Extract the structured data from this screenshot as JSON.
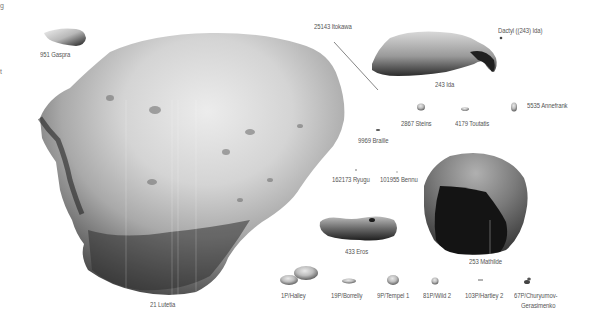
{
  "figure": {
    "background": "#ffffff",
    "label_color": "#555555",
    "bodies": [
      {
        "id": "lutetia",
        "label": "21 Lutetia",
        "kind": "asteroid"
      },
      {
        "id": "gaspra",
        "label": "951 Gaspra",
        "kind": "asteroid"
      },
      {
        "id": "itokawa",
        "label": "25143 Itokawa",
        "kind": "asteroid"
      },
      {
        "id": "ida",
        "label": "243 Ida",
        "kind": "asteroid"
      },
      {
        "id": "dactyl",
        "label": "Dactyl ((243) Ida)",
        "kind": "moon"
      },
      {
        "id": "steins",
        "label": "2867 Steins",
        "kind": "asteroid"
      },
      {
        "id": "toutatis",
        "label": "4179 Toutatis",
        "kind": "asteroid"
      },
      {
        "id": "annefrank",
        "label": "5535 Annefrank",
        "kind": "asteroid"
      },
      {
        "id": "braille",
        "label": "9969 Braille",
        "kind": "asteroid"
      },
      {
        "id": "ryugu",
        "label": "162173 Ryugu",
        "kind": "asteroid"
      },
      {
        "id": "bennu",
        "label": "101955 Bennu",
        "kind": "asteroid"
      },
      {
        "id": "eros",
        "label": "433 Eros",
        "kind": "asteroid"
      },
      {
        "id": "mathilde",
        "label": "253 Mathilde",
        "kind": "asteroid"
      },
      {
        "id": "halley",
        "label": "1P/Halley",
        "kind": "comet"
      },
      {
        "id": "borrelly",
        "label": "19P/Borrelly",
        "kind": "comet"
      },
      {
        "id": "tempel1",
        "label": "9P/Tempel 1",
        "kind": "comet"
      },
      {
        "id": "wild2",
        "label": "81P/Wild 2",
        "kind": "comet"
      },
      {
        "id": "hartley2",
        "label": "103P/Hartley 2",
        "kind": "comet"
      },
      {
        "id": "cg",
        "label_line1": "67P/Churyumov-",
        "label_line2": "Gerasimenko",
        "kind": "comet"
      }
    ],
    "edge_fragments": [
      "g",
      "t"
    ]
  }
}
